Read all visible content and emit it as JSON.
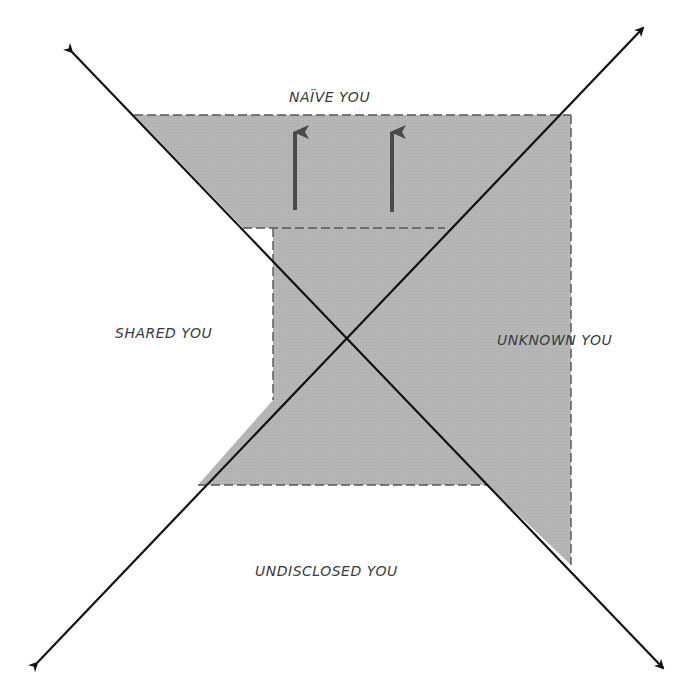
{
  "diagram": {
    "labels": {
      "naive": "NAÏVE YOU",
      "shared": "SHARED YOU",
      "unknown": "UNKNOWN YOU",
      "undisclosed": "UNDISCLOSED YOU"
    },
    "colors": {
      "shade": "#b4b4b4",
      "lines": "#111111",
      "dashes": "#555555",
      "arrows": "#4a4a4a",
      "text": "#3a3a3a"
    },
    "axes": [
      {
        "name": "descending-diagonal",
        "from": [
          72,
          52
        ],
        "to": [
          663,
          668
        ]
      },
      {
        "name": "ascending-diagonal",
        "from": [
          37,
          663
        ],
        "to": [
          643,
          28
        ]
      }
    ],
    "shaded_region_points": [
      [
        134,
        115
      ],
      [
        571,
        115
      ],
      [
        571,
        565
      ],
      [
        487,
        485
      ],
      [
        198,
        485
      ],
      [
        273,
        400
      ],
      [
        273,
        228
      ],
      [
        243,
        228
      ]
    ],
    "growth_arrows": [
      {
        "x": 295,
        "y_start": 210,
        "y_end": 127
      },
      {
        "x": 392,
        "y_start": 212,
        "y_end": 127
      }
    ]
  }
}
